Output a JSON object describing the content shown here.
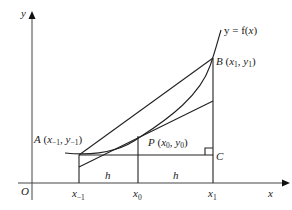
{
  "diagram": {
    "axes": {
      "x_label": "x",
      "y_label": "y",
      "origin_label": "O"
    },
    "curve_label": {
      "lhs": "y = f(",
      "var": "x",
      "rhs": ")"
    },
    "points": {
      "A": {
        "name": "A",
        "x": "x",
        "x_sub": "−1",
        "y": "y",
        "y_sub": "−1"
      },
      "B": {
        "name": "B",
        "x": "x",
        "x_sub": "1",
        "y": "y",
        "y_sub": "1"
      },
      "P": {
        "name": "P",
        "x": "x",
        "x_sub": "0",
        "y": "y",
        "y_sub": "0"
      },
      "C": {
        "name": "C"
      }
    },
    "ticks": [
      {
        "var": "x",
        "sub": "−1"
      },
      {
        "var": "x",
        "sub": "0"
      },
      {
        "var": "x",
        "sub": "1"
      }
    ],
    "intervals": [
      "h",
      "h"
    ],
    "colors": {
      "line": "#222222",
      "axis": "#444444"
    }
  }
}
